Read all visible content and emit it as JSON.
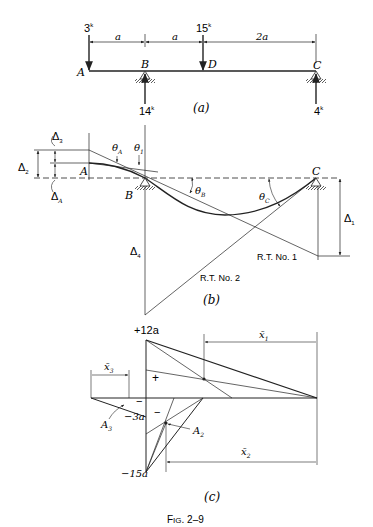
{
  "figure": {
    "caption": "Fig. 2–9",
    "caption_small": "IG",
    "caption_num": ". 2–9",
    "caption_big": "F"
  },
  "panel_a": {
    "label": "(a)",
    "points": {
      "A": "A",
      "B": "B",
      "C": "C",
      "D": "D"
    },
    "loads": {
      "at_A": "3",
      "at_D": "15"
    },
    "reactions": {
      "at_B": "14",
      "at_C": "4"
    },
    "unit_sup": "k",
    "dims": [
      "a",
      "a",
      "2a"
    ]
  },
  "panel_b": {
    "label": "(b)",
    "points": {
      "A": "A",
      "B": "B",
      "C": "C"
    },
    "deltas": {
      "d1": "Δ",
      "d1_sub": "1",
      "d2": "Δ",
      "d2_sub": "2",
      "d3": "Δ",
      "d3_sub": "3",
      "d4": "Δ",
      "d4_sub": "4",
      "dA": "Δ",
      "dA_sub": "A"
    },
    "thetas": {
      "tA": "θ",
      "tA_sub": "A",
      "t1": "θ",
      "t1_sub": "1",
      "tB": "θ",
      "tB_sub": "B",
      "tC": "θ",
      "tC_sub": "C"
    },
    "rt1": "R.T. No. 1",
    "rt2": "R.T. No. 2"
  },
  "panel_c": {
    "label": "(c)",
    "top_value": "+12a",
    "neg_value_1": "−3a",
    "neg_value_2": "−15a",
    "plus": "+",
    "minus": "−",
    "areas": {
      "A2": "A",
      "A2_sub": "2",
      "A3": "A",
      "A3_sub": "3"
    },
    "xbars": {
      "x1": "x̄",
      "x1_sub": "1",
      "x2": "x̄",
      "x2_sub": "2",
      "x3": "x̄",
      "x3_sub": "3"
    }
  }
}
